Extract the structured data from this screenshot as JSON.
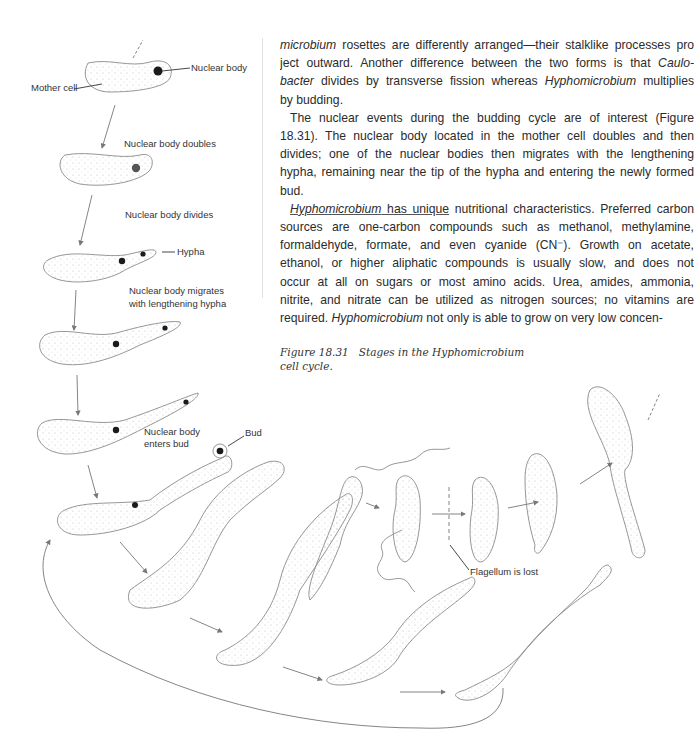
{
  "page": {
    "body_paragraphs": [
      {
        "lines": [
          [
            {
              "t": "microbium",
              "i": true
            },
            {
              "t": " rosettes are differently arranged—their stalklike processes pro"
            }
          ],
          [
            {
              "t": "ject outward. Another difference between the two forms is that "
            },
            {
              "t": "Caulo-",
              "i": true
            }
          ],
          [
            {
              "t": "bacter",
              "i": true
            },
            {
              "t": " divides by transverse fission whereas "
            },
            {
              "t": "Hyphomicrobium",
              "i": true
            },
            {
              "t": " multiplies"
            }
          ],
          [
            {
              "t": "by budding."
            }
          ]
        ]
      },
      {
        "lines": [
          [
            {
              "t": "The nuclear events during the budding cycle are of interest (Figure"
            }
          ],
          [
            {
              "t": "18.31). The nuclear body located in the mother cell doubles and then"
            }
          ],
          [
            {
              "t": "divides; one of the nuclear bodies then migrates with the lengthening"
            }
          ],
          [
            {
              "t": "hypha, remaining near the tip of the hypha and entering the newly formed"
            }
          ],
          [
            {
              "t": "bud."
            }
          ]
        ]
      },
      {
        "lines": [
          [
            {
              "t": "Hyphomicrobium",
              "i": true,
              "u": true
            },
            {
              "t": " has unique",
              "u": true
            },
            {
              "t": " nutritional characteristics. Preferred carbon"
            }
          ],
          [
            {
              "t": "sources are one-carbon compounds such as methanol, methylamine,"
            }
          ],
          [
            {
              "t": "formaldehyde, formate, and even cyanide (CN⁻). Growth on acetate,"
            }
          ],
          [
            {
              "t": "ethanol, or higher aliphatic compounds is usually slow, and does not"
            }
          ],
          [
            {
              "t": "occur at all on sugars or most amino acids. Urea, amides, ammonia,"
            }
          ],
          [
            {
              "t": "nitrite, and nitrate can be utilized as nitrogen sources; no vitamins are"
            }
          ],
          [
            {
              "t": "required. "
            },
            {
              "t": "Hyphomicrobium",
              "i": true
            },
            {
              "t": " not only is able to grow on very low concen-"
            }
          ]
        ]
      }
    ],
    "caption": {
      "number": "Figure 18.31",
      "text_line1": "Stages in the Hyphomicrobium",
      "text_line2": "cell cycle."
    }
  },
  "figure": {
    "labels": {
      "mother_cell": "Mother cell",
      "nuclear_body": "Nuclear body",
      "nuclear_body_doubles": "Nuclear body doubles",
      "nuclear_body_divides": "Nuclear body divides",
      "hypha": "Hypha",
      "migrates_line1": "Nuclear body migrates",
      "migrates_line2": "with lengthening hypha",
      "enters_line1": "Nuclear body",
      "enters_line2": "enters bud",
      "bud": "Bud",
      "flagellum_lost": "Flagellum is lost"
    },
    "colors": {
      "outline": "#8a8a8a",
      "stipple": "#c8c8c8",
      "nucleus": "#1a1a1a",
      "arrow": "#777777"
    }
  }
}
